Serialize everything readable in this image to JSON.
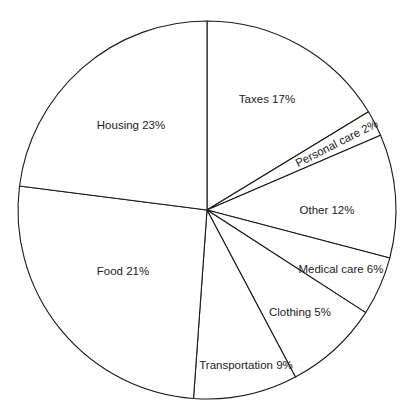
{
  "chart_data": {
    "type": "pie",
    "title": "",
    "center": [
      207,
      210
    ],
    "radius": 189,
    "start_angle_deg": -90,
    "direction": "clockwise",
    "slices": [
      {
        "label": "Taxes",
        "value": 17,
        "text": "Taxes 17%",
        "end_angle_deg": -31.3,
        "label_pos": [
          267,
          100
        ],
        "rotate": 0
      },
      {
        "label": "Personal care",
        "value": 2,
        "text": "Personal care 2%",
        "end_angle_deg": -23.3,
        "label_pos": [
          337,
          144
        ],
        "rotate": -27
      },
      {
        "label": "Other",
        "value": 12,
        "text": "Other 12%",
        "end_angle_deg": 14.7,
        "label_pos": [
          327,
          211
        ],
        "rotate": 0
      },
      {
        "label": "Medical care",
        "value": 6,
        "text": "Medical care 6%",
        "end_angle_deg": 32.9,
        "label_pos": [
          341,
          270
        ],
        "rotate": 0
      },
      {
        "label": "Clothing",
        "value": 5,
        "text": "Clothing 5%",
        "end_angle_deg": 62.1,
        "label_pos": [
          300,
          313
        ],
        "rotate": 0
      },
      {
        "label": "Transportation",
        "value": 9,
        "text": "Transportation 9%",
        "end_angle_deg": 94.1,
        "label_pos": [
          246,
          366
        ],
        "rotate": 0
      },
      {
        "label": "Food",
        "value": 21,
        "text": "Food 21%",
        "end_angle_deg": 187.3,
        "label_pos": [
          123,
          272
        ],
        "rotate": 0
      },
      {
        "label": "Housing",
        "value": 23,
        "text": "Housing 23%",
        "end_angle_deg": 270,
        "label_pos": [
          131,
          126
        ],
        "rotate": 0
      }
    ],
    "categories": [
      "Taxes",
      "Personal care",
      "Other",
      "Medical care",
      "Clothing",
      "Transportation",
      "Food",
      "Housing"
    ],
    "values": [
      17,
      2,
      12,
      6,
      5,
      9,
      21,
      23
    ],
    "unit": "%",
    "legend": "none (labels inside slices)",
    "colors": {
      "fill": "#ffffff",
      "stroke": "#1a1a1a",
      "text": "#222222"
    }
  }
}
